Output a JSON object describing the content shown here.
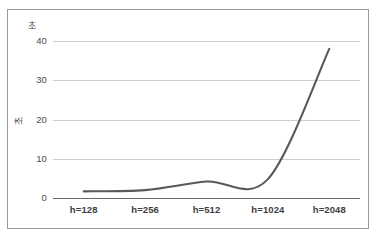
{
  "chart_data": {
    "type": "line",
    "title": "",
    "subtitle": "",
    "xlabel": "",
    "ylabel": "초",
    "y_unit_label": "초",
    "categories": [
      "h=128",
      "h=256",
      "h=512",
      "h=1024",
      "h=2048"
    ],
    "series": [
      {
        "name": "",
        "values": [
          1.7,
          2.0,
          4.2,
          4.8,
          38.0
        ]
      }
    ],
    "ylim": [
      0,
      40
    ],
    "yticks": [
      0,
      10,
      20,
      30,
      40
    ],
    "ytick_labels": [
      "0",
      "10",
      "20",
      "30",
      "40"
    ],
    "grid": true,
    "grid_axis": "y",
    "legend": false,
    "legend_position": "none",
    "line_color": "#595959",
    "grid_color": "#cfcfcf",
    "axis_color": "#6b6b6b",
    "background_color": "#ffffff",
    "frame_color": "#9a9a9a",
    "annotations": []
  }
}
